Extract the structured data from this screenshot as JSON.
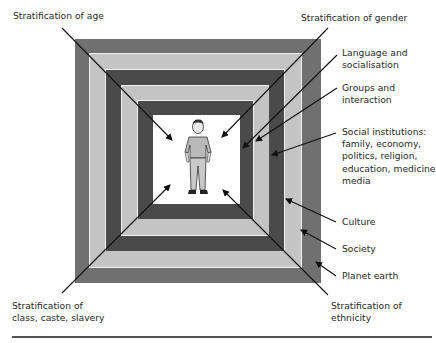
{
  "diagram": {
    "type": "nested-squares",
    "colors": {
      "outer": "#707070",
      "light": "#c4c4c4",
      "dark": "#4a4a4a",
      "separator": "#f4f4f4",
      "center": "#ffffff",
      "line": "#111111"
    },
    "center_figure": "person-figure",
    "layers_outer_to_inner": [
      "Planet earth",
      "Society",
      "Culture",
      "Social institutions",
      "Groups and interaction",
      "Language and socialisation"
    ]
  },
  "labels": {
    "age": "Stratification of age",
    "gender": "Stratification of gender",
    "language": "Language and\nsocialisation",
    "groups": "Groups and\ninteraction",
    "institutions": "Social institutions:\nfamily, economy,\npolitics, religion,\neducation, medicine\nmedia",
    "culture": "Culture",
    "society": "Society",
    "planet": "Planet earth",
    "class": "Stratification of\nclass, caste, slavery",
    "ethnicity": "Stratification of\nethnicity"
  }
}
